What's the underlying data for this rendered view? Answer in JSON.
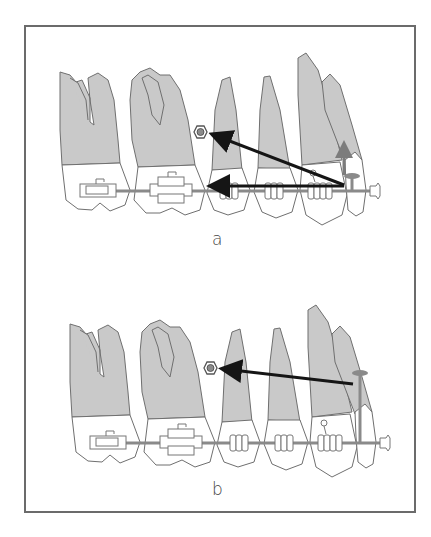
{
  "figure": {
    "panels": [
      {
        "id": "a",
        "label": "a",
        "force_vectors": [
          {
            "name": "miniscrew-retraction",
            "direction": "toward miniscrew",
            "color": "#151515"
          },
          {
            "name": "horizontal-retraction",
            "direction": "distal along archwire",
            "color": "#151515"
          },
          {
            "name": "vertical-intrusion",
            "direction": "upward",
            "color": "#7c7c7c"
          }
        ]
      },
      {
        "id": "b",
        "label": "b",
        "force_vectors": [
          {
            "name": "miniscrew-retraction",
            "direction": "toward miniscrew",
            "color": "#151515"
          }
        ]
      }
    ],
    "colors": {
      "root": "#c9c9c9",
      "outline": "#6f6f6f",
      "archwire": "#8a8a8a",
      "force_arrow": "#151515",
      "intrusion_arrow": "#7c7c7c",
      "frame": "#6b6b6b"
    }
  }
}
